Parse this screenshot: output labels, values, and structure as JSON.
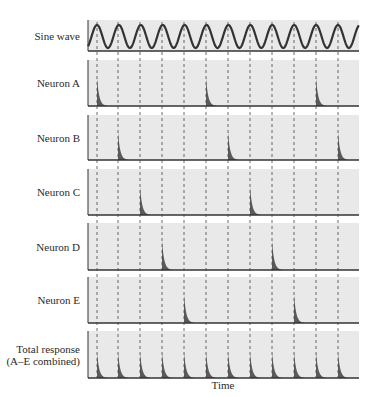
{
  "figure": {
    "x_axis_label": "Time",
    "colors": {
      "panel_bg": "#e9e9e9",
      "axis": "#333333",
      "wave": "#333333",
      "spike": "#5a5a5a",
      "dashed": "#444444"
    },
    "panel_left": 88,
    "panel_right": 359,
    "cycle_lines_x": [
      97,
      118,
      140,
      162,
      184,
      206,
      228,
      250,
      272,
      294,
      316,
      338
    ],
    "panels": [
      {
        "label": [
          "Sine wave"
        ],
        "type": "sine",
        "top": 20,
        "bottom": 51
      },
      {
        "label": [
          "Neuron A"
        ],
        "type": "spikes",
        "top": 60,
        "bottom": 106,
        "spike_cycles": [
          0,
          5,
          10
        ],
        "height_frac": 0.62
      },
      {
        "label": [
          "Neuron B"
        ],
        "type": "spikes",
        "top": 115,
        "bottom": 160,
        "spike_cycles": [
          1,
          6,
          11
        ],
        "height_frac": 0.62
      },
      {
        "label": [
          "Neuron C"
        ],
        "type": "spikes",
        "top": 169,
        "bottom": 215,
        "spike_cycles": [
          2,
          7
        ],
        "height_frac": 0.62
      },
      {
        "label": [
          "Neuron D"
        ],
        "type": "spikes",
        "top": 223,
        "bottom": 270,
        "spike_cycles": [
          3,
          8
        ],
        "height_frac": 0.62
      },
      {
        "label": [
          "Neuron E"
        ],
        "type": "spikes",
        "top": 277,
        "bottom": 323,
        "spike_cycles": [
          4,
          9
        ],
        "height_frac": 0.62
      },
      {
        "label": [
          "Total response",
          "(A–E combined)"
        ],
        "type": "spikes",
        "top": 331,
        "bottom": 378,
        "spike_cycles": [
          0,
          1,
          2,
          3,
          4,
          5,
          6,
          7,
          8,
          9,
          10,
          11
        ],
        "height_frac": 0.55
      }
    ]
  }
}
